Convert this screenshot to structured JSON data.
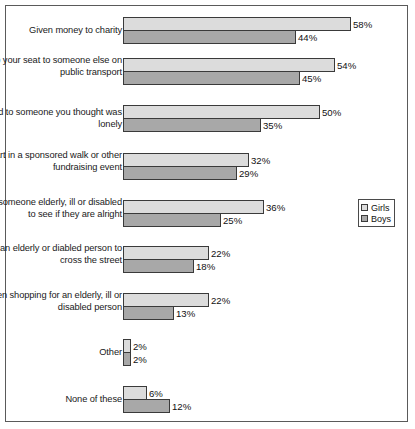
{
  "chart_data": {
    "type": "bar",
    "orientation": "horizontal",
    "title": "",
    "subtitle": "",
    "xlabel": "",
    "ylabel": "",
    "xlim": [
      0,
      60
    ],
    "grid": false,
    "legend_position": "right-middle",
    "value_suffix": "%",
    "categories": [
      "Given money to charity",
      "Given up your seat to someone else on public transport",
      "Chatted to someone you thought was lonely",
      "Taken part in a sponsored walk or other fundraising event",
      "Visited someone elderly, ill or disabled to see if they are alright",
      "Helped an elderly or diabled person to cross the street",
      "Been shopping for an elderly, ill or disabled person",
      "Other",
      "None of these"
    ],
    "series": [
      {
        "name": "Girls",
        "color": "#dcdcdc",
        "values": [
          58,
          54,
          50,
          32,
          36,
          22,
          22,
          2,
          6
        ],
        "labels": [
          "58%",
          "54%",
          "50%",
          "32%",
          "36%",
          "22%",
          "22%",
          "2%",
          "6%"
        ]
      },
      {
        "name": "Boys",
        "color": "#a8a8a8",
        "values": [
          44,
          45,
          35,
          29,
          25,
          18,
          13,
          2,
          12
        ],
        "labels": [
          "44%",
          "45%",
          "35%",
          "29%",
          "25%",
          "18%",
          "13%",
          "2%",
          "12%"
        ]
      }
    ]
  },
  "legend": {
    "items": [
      {
        "label": "Girls"
      },
      {
        "label": "Boys"
      }
    ]
  },
  "layout": {
    "rows": [
      {
        "top": 11
      },
      {
        "top": 52
      },
      {
        "top": 99
      },
      {
        "top": 147
      },
      {
        "top": 194
      },
      {
        "top": 240
      },
      {
        "top": 287
      },
      {
        "top": 333
      },
      {
        "top": 380
      }
    ],
    "px_per_percent": 3.93,
    "label_centers": [
      18,
      65,
      112,
      160,
      207,
      253,
      300,
      346,
      393
    ]
  }
}
